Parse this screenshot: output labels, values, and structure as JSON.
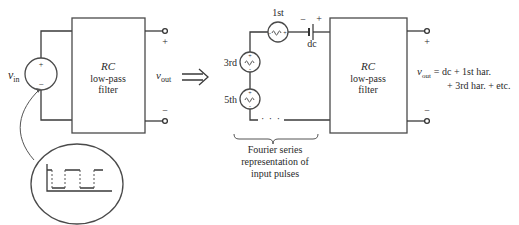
{
  "left_circuit": {
    "source_label": "v",
    "source_subscript": "in",
    "source_plus": "+",
    "source_minus": "−",
    "filter": {
      "line1": "RC",
      "line2": "low-pass",
      "line3": "filter"
    },
    "output_label": "v",
    "output_subscript": "out",
    "terminal_plus": "+",
    "terminal_minus": "−"
  },
  "inset": {
    "description": "input pulse train waveform",
    "levels": {
      "high": 1,
      "low": 0
    },
    "segments": [
      "high",
      "low",
      "high",
      "low",
      "high"
    ]
  },
  "arrow": {
    "symbol": "implies-arrow"
  },
  "right_circuit": {
    "sources": [
      {
        "label": "1st",
        "symbol": "~"
      },
      {
        "label": "3rd",
        "symbol": "~"
      },
      {
        "label": "5th",
        "symbol": "~"
      }
    ],
    "battery": {
      "label": "dc",
      "minus": "−",
      "plus": "+"
    },
    "continuation": "· · ·",
    "filter": {
      "line1": "RC",
      "line2": "low-pass",
      "line3": "filter"
    },
    "terminal_plus": "+",
    "terminal_minus": "−",
    "brace_caption": {
      "line1": "Fourier series",
      "line2": "representation of",
      "line3": "input pulses"
    },
    "equation": {
      "lhs": "v",
      "lhs_subscript": "out",
      "line1": "= dc + 1st har.",
      "line2": "+ 3rd har. + etc."
    }
  }
}
